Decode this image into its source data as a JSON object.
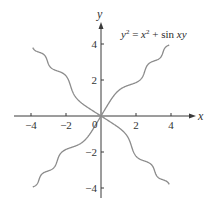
{
  "chart_data": {
    "type": "line",
    "title": "",
    "annotation": "y^2 = x^2 + sin xy",
    "xlabel": "x",
    "ylabel": "y",
    "xlim": [
      -5,
      5.3
    ],
    "ylim": [
      -4.6,
      5.3
    ],
    "grid": false,
    "legend": null,
    "x_ticks": [
      -4,
      -2,
      0,
      2,
      4
    ],
    "x_tick_labels": [
      "-4",
      "-2",
      "0",
      "2",
      "4"
    ],
    "y_ticks": [
      -4,
      -2,
      2,
      4
    ],
    "y_tick_labels": [
      "-4",
      "-2",
      "2",
      "4"
    ],
    "series": [
      {
        "name": "branch-upper-right",
        "x": [
          0,
          0.5,
          1.0,
          1.5,
          2.0,
          2.5,
          3.0,
          3.5,
          3.9
        ],
        "y": [
          0,
          0.68,
          1.41,
          1.68,
          1.87,
          2.46,
          3.06,
          3.41,
          3.95
        ]
      },
      {
        "name": "branch-lower-left",
        "x": [
          0,
          -0.5,
          -1.0,
          -1.5,
          -2.0,
          -2.5,
          -3.0,
          -3.5,
          -3.9
        ],
        "y": [
          0,
          -0.68,
          -1.41,
          -1.68,
          -1.87,
          -2.46,
          -3.06,
          -3.41,
          -3.95
        ]
      },
      {
        "name": "branch-upper-left",
        "x": [
          0,
          -0.5,
          -1.0,
          -1.5,
          -2.0,
          -2.5,
          -3.0,
          -3.5,
          -3.9
        ],
        "y": [
          0,
          0.28,
          0.46,
          1.16,
          2.12,
          2.54,
          2.94,
          3.58,
          4.0
        ]
      },
      {
        "name": "branch-lower-right",
        "x": [
          0,
          0.5,
          1.0,
          1.5,
          2.0,
          2.5,
          3.0,
          3.5,
          3.9
        ],
        "y": [
          0,
          -0.28,
          -0.46,
          -1.16,
          -2.12,
          -2.54,
          -2.94,
          -3.58,
          -4.0
        ]
      }
    ]
  },
  "labels": {
    "x_axis": "x",
    "y_axis": "y",
    "equation_lhs": "y",
    "equation_lhs_exp": "2",
    "equation_eq": " = ",
    "equation_x": "x",
    "equation_x_exp": "2",
    "equation_plus": " + sin ",
    "equation_xy": "xy",
    "origin": "0"
  },
  "style": {
    "curve_color": "#8c8c8c",
    "axis_color": "#3a3a3a"
  }
}
